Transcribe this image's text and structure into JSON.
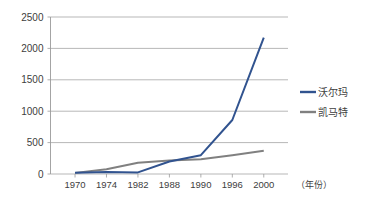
{
  "chart_data": {
    "type": "line",
    "title": "",
    "xlabel": "（年份）",
    "ylabel": "",
    "categories": [
      "1970",
      "1974",
      "1982",
      "1988",
      "1990",
      "1996",
      "2000"
    ],
    "ylim": [
      0,
      2500
    ],
    "yticks": [
      "0",
      "500",
      "1000",
      "1500",
      "2000",
      "2500"
    ],
    "ytick_values": [
      0,
      500,
      1000,
      1500,
      2000,
      2500
    ],
    "grid": true,
    "legend_position": "right",
    "series": [
      {
        "name": "沃尔玛",
        "color": "#31538f",
        "values": [
          18,
          30,
          25,
          200,
          300,
          860,
          2170
        ]
      },
      {
        "name": "凯马特",
        "color": "#808080",
        "values": [
          18,
          75,
          180,
          215,
          235,
          300,
          370
        ]
      }
    ]
  },
  "axis": {
    "x_title": "（年份）"
  },
  "legend": {
    "items": [
      {
        "label": "沃尔玛",
        "color": "#31538f"
      },
      {
        "label": "凯马特",
        "color": "#808080"
      }
    ]
  }
}
